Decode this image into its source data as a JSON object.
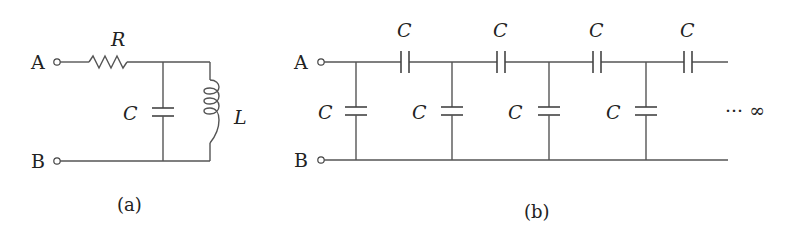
{
  "figure_a": {
    "terminal_top": "A",
    "terminal_bottom": "B",
    "resistor_label": "R",
    "capacitor_label": "C",
    "inductor_label": "L",
    "caption": "(a)"
  },
  "figure_b": {
    "terminal_top": "A",
    "terminal_bottom": "B",
    "series_capacitor_labels": [
      "C",
      "C",
      "C",
      "C"
    ],
    "shunt_capacitor_labels": [
      "C",
      "C",
      "C",
      "C"
    ],
    "continuation": "··· ∞",
    "caption": "(b)"
  }
}
